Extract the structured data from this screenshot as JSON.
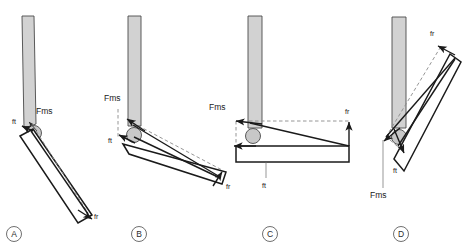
{
  "figure": {
    "background_color": "#ffffff",
    "line_color": "#1a1a1a",
    "bone_fill_color": "#d2d2d2",
    "dashed_color": "#8a8a8a"
  },
  "labels": {
    "fms": "Fms",
    "ft": "ft",
    "fr": "fr"
  },
  "panels": [
    {
      "id": "A",
      "letter": "A",
      "labels": {
        "fms": "Fms",
        "ft": "ft",
        "fr": "fr"
      }
    },
    {
      "id": "B",
      "letter": "B",
      "labels": {
        "fms": "Fms",
        "ft": "ft",
        "fr": "fr"
      }
    },
    {
      "id": "C",
      "letter": "C",
      "labels": {
        "fms": "Fms",
        "ft": "ft",
        "fr": "fr"
      }
    },
    {
      "id": "D",
      "letter": "D",
      "labels": {
        "fms": "Fms",
        "ft": "ft",
        "fr": "fr"
      }
    }
  ]
}
